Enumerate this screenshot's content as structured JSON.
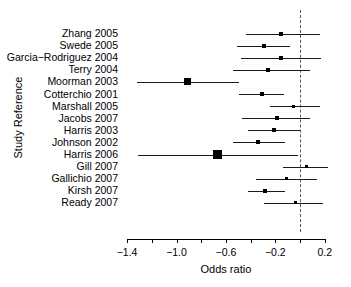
{
  "chart_data": {
    "type": "scatter",
    "chart_subtype": "forest-plot",
    "title": "",
    "xlabel": "Odds ratio",
    "ylabel": "Study Reference",
    "xlim": [
      -1.55,
      0.34
    ],
    "xticks": [
      -1.4,
      -1.2,
      -1.0,
      -0.8,
      -0.6,
      -0.4,
      -0.2,
      0.0,
      0.2
    ],
    "xtick_labels": [
      "-1.4",
      "",
      "-1.0",
      "",
      "-0.6",
      "",
      "-0.2",
      "",
      "0.2"
    ],
    "grid": false,
    "legend": "none",
    "reference_line": 0.0,
    "reference_line_style": "dashed",
    "categories": [
      "Zhang 2005",
      "Swede 2005",
      "Garcia−Rodriguez 2004",
      "Terry 2004",
      "Moorman 2003",
      "Cotterchio 2001",
      "Marshall 2005",
      "Jacobs 2007",
      "Harris 2003",
      "Johnson 2002",
      "Harris 2006",
      "Gill 2007",
      "Gallichio 2007",
      "Kirsh 2007",
      "Ready 2007"
    ],
    "points": [
      {
        "study": "Zhang 2005",
        "estimate": -0.15,
        "ci_low": -0.44,
        "ci_high": 0.16,
        "marker_size": 4
      },
      {
        "study": "Swede 2005",
        "estimate": -0.29,
        "ci_low": -0.51,
        "ci_high": -0.08,
        "marker_size": 4
      },
      {
        "study": "Garcia−Rodriguez 2004",
        "estimate": -0.15,
        "ci_low": -0.48,
        "ci_high": 0.17,
        "marker_size": 4
      },
      {
        "study": "Terry 2004",
        "estimate": -0.26,
        "ci_low": -0.54,
        "ci_high": 0.08,
        "marker_size": 4
      },
      {
        "study": "Moorman 2003",
        "estimate": -0.91,
        "ci_low": -1.32,
        "ci_high": -0.49,
        "marker_size": 7
      },
      {
        "study": "Cotterchio 2001",
        "estimate": -0.31,
        "ci_low": -0.49,
        "ci_high": -0.13,
        "marker_size": 4
      },
      {
        "study": "Marshall 2005",
        "estimate": -0.05,
        "ci_low": -0.24,
        "ci_high": 0.16,
        "marker_size": 3
      },
      {
        "study": "Jacobs 2007",
        "estimate": -0.19,
        "ci_low": -0.47,
        "ci_high": 0.08,
        "marker_size": 4
      },
      {
        "study": "Harris 2003",
        "estimate": -0.21,
        "ci_low": -0.42,
        "ci_high": 0.0,
        "marker_size": 4
      },
      {
        "study": "Johnson 2002",
        "estimate": -0.34,
        "ci_low": -0.54,
        "ci_high": -0.12,
        "marker_size": 4
      },
      {
        "study": "Harris 2006",
        "estimate": -0.67,
        "ci_low": -1.31,
        "ci_high": -0.02,
        "marker_size": 9
      },
      {
        "study": "Gill 2007",
        "estimate": 0.05,
        "ci_low": -0.14,
        "ci_high": 0.23,
        "marker_size": 3
      },
      {
        "study": "Gallichio 2007",
        "estimate": -0.11,
        "ci_low": -0.36,
        "ci_high": 0.14,
        "marker_size": 3
      },
      {
        "study": "Kirsh 2007",
        "estimate": -0.28,
        "ci_low": -0.42,
        "ci_high": -0.12,
        "marker_size": 4
      },
      {
        "study": "Ready 2007",
        "estimate": -0.04,
        "ci_low": -0.29,
        "ci_high": 0.19,
        "marker_size": 3
      }
    ]
  },
  "axes": {
    "x_title": "Odds ratio",
    "y_title": "Study Reference"
  },
  "colors": {
    "marker": "#000000",
    "line": "#1a1a1a",
    "reference": "#555555",
    "axis": "#000000",
    "background": "#ffffff"
  }
}
